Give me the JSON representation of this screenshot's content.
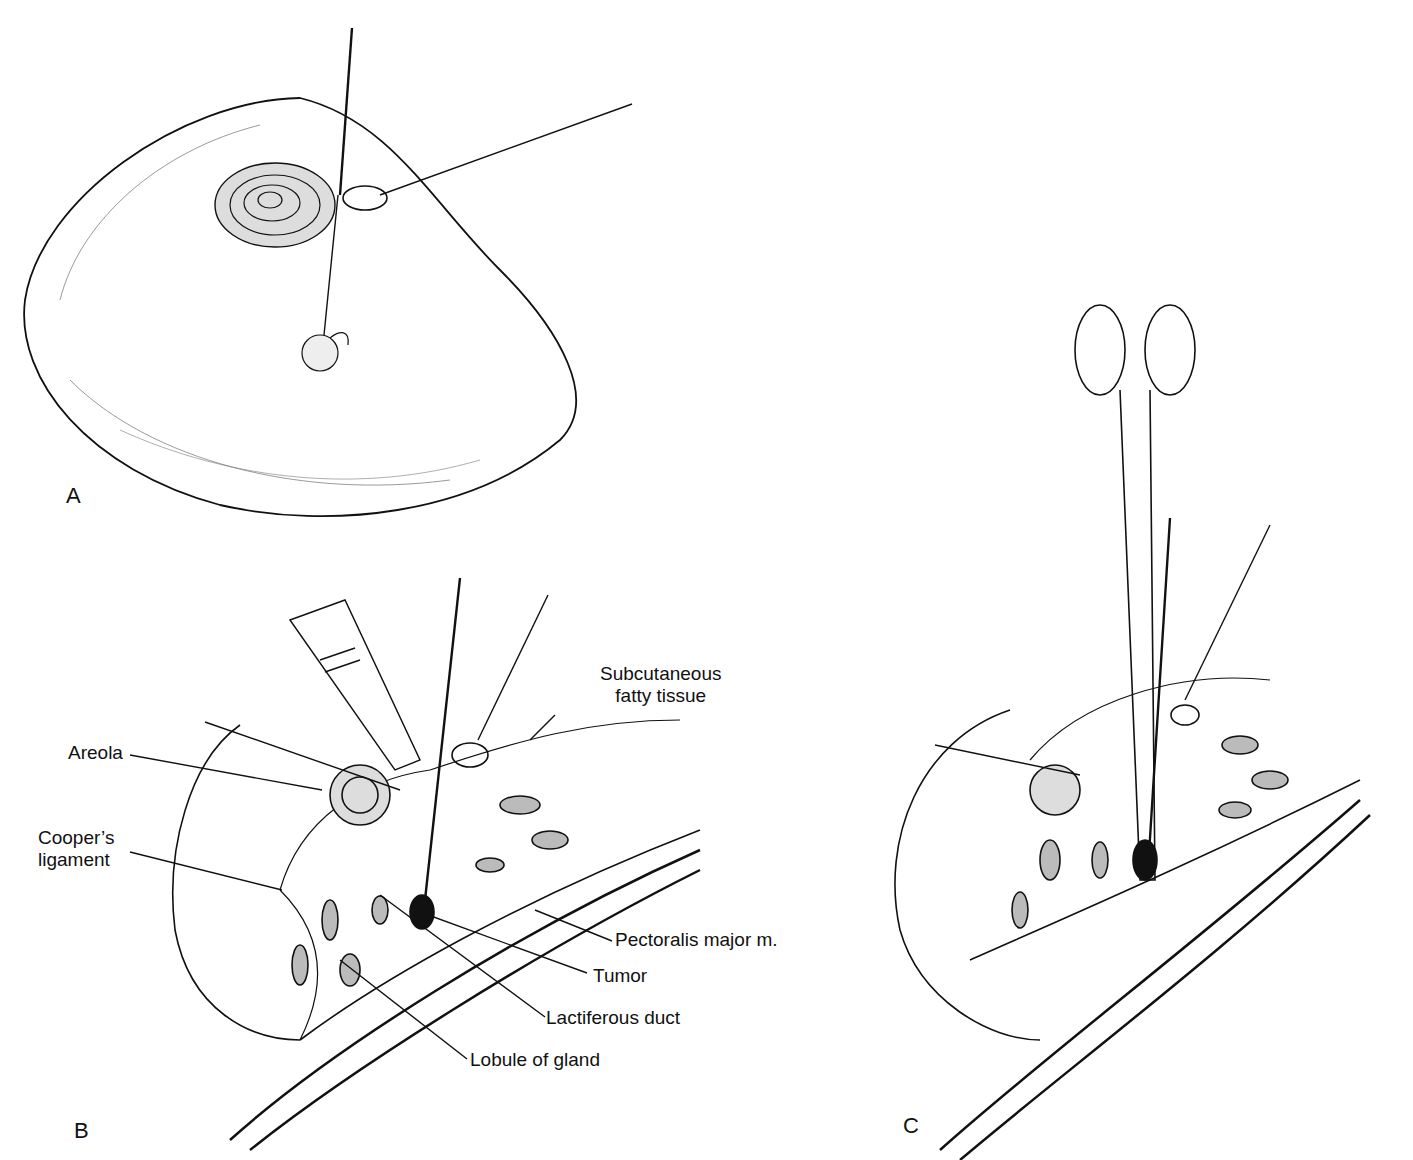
{
  "figure": {
    "panels": [
      {
        "id": "A",
        "letter": "A",
        "description": "Breast with needle localization wire and retractor at areola"
      },
      {
        "id": "B",
        "letter": "B",
        "description": "Cross-section showing dissection along localization wire with scalpel"
      },
      {
        "id": "C",
        "letter": "C",
        "description": "Cross-section with hemostat clamp grasping tissue around wire and tumor"
      }
    ],
    "labels": {
      "subcutaneous": {
        "line1": "Subcutaneous",
        "line2": "fatty tissue"
      },
      "areola": "Areola",
      "coopers": {
        "line1": "Cooper’s",
        "line2": "ligament"
      },
      "pectoralis": "Pectoralis major m.",
      "tumor": "Tumor",
      "lactiferous": "Lactiferous duct",
      "lobule": "Lobule of gland"
    },
    "colors": {
      "ink": "#111111",
      "background": "#ffffff"
    }
  }
}
